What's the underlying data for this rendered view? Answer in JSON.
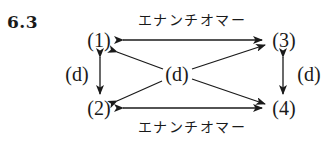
{
  "problem": {
    "number": "6.3"
  },
  "nodes": {
    "n1": "(1)",
    "n2": "(2)",
    "n3": "(3)",
    "n4": "(4)",
    "center": "(d)"
  },
  "labels": {
    "top_relation": "エナンチオマー",
    "bottom_relation": "エナンチオマー",
    "left_relation": "(d)",
    "right_relation": "(d)"
  },
  "colors": {
    "ink": "#1a1a1a",
    "background": "#ffffff"
  }
}
